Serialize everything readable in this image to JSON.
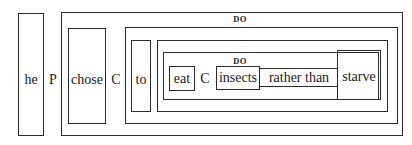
{
  "diagram": {
    "type": "nested-box-parse",
    "subject": "he",
    "predicate_marker": "P",
    "verb": "chose",
    "complement_marker_outer": "C",
    "infinitive_marker": "to",
    "outer_role_label": "DO",
    "inner_role_label": "DO",
    "inner_verb": "eat",
    "complement_marker_inner": "C",
    "object": "insects",
    "connector": "rather than",
    "alternative": "starve"
  }
}
